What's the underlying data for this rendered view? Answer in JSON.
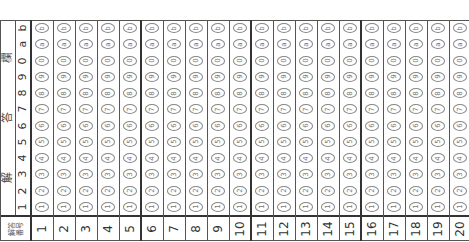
{
  "sheet": {
    "title_chars": [
      "解",
      "答",
      "欄"
    ],
    "header_label": "解答\n番号",
    "row_labels": [
      "b",
      "a",
      "0",
      "9",
      "8",
      "7",
      "6",
      "5",
      "4",
      "3",
      "2",
      "1"
    ],
    "questions": [
      "1",
      "2",
      "3",
      "4",
      "5",
      "6",
      "7",
      "8",
      "9",
      "10",
      "11",
      "12",
      "13",
      "14",
      "15",
      "16",
      "17",
      "18",
      "19",
      "20"
    ],
    "orientation": "rotated -90deg",
    "colors": {
      "line": "#555555",
      "bubble_outline": "#888888",
      "text": "#333333"
    }
  }
}
